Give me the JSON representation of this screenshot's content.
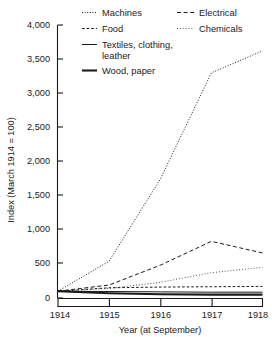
{
  "chart_data": {
    "type": "line",
    "title": "",
    "xlabel": "Year (at September)",
    "ylabel": "Index (March 1914 = 100)",
    "x": [
      1914,
      1915,
      1916,
      1917,
      1918
    ],
    "xticklabels": [
      "1914",
      "1915",
      "1916",
      "1917",
      "1918"
    ],
    "xlim": [
      1914,
      1918
    ],
    "ylim": [
      0,
      4000
    ],
    "yticks": [
      0,
      500,
      1000,
      1500,
      2000,
      2500,
      3000,
      3500,
      4000
    ],
    "yticklabels": [
      "0",
      "500",
      "1,000",
      "1,500",
      "2,000",
      "2,500",
      "3,000",
      "3,500",
      "4,000"
    ],
    "grid": false,
    "legend_position": "top-inside",
    "series": [
      {
        "name": "Machines",
        "style": "dotted-fine",
        "values": [
          100,
          540,
          1740,
          3300,
          3620
        ]
      },
      {
        "name": "Electrical",
        "style": "dashed-long",
        "values": [
          100,
          190,
          480,
          830,
          660
        ]
      },
      {
        "name": "Food",
        "style": "dashed-medium",
        "values": [
          100,
          150,
          160,
          165,
          170
        ]
      },
      {
        "name": "Chemicals",
        "style": "dotted-sparse",
        "values": [
          100,
          140,
          230,
          370,
          450
        ]
      },
      {
        "name": "Textiles, clothing, leather",
        "style": "solid-thin",
        "values": [
          100,
          95,
          90,
          85,
          85
        ]
      },
      {
        "name": "Wood, paper",
        "style": "solid-thick",
        "values": [
          100,
          70,
          55,
          50,
          50
        ]
      }
    ]
  },
  "legend": {
    "items": [
      {
        "label": "Machines",
        "style": "dotted-fine"
      },
      {
        "label": "Electrical",
        "style": "dashed-long"
      },
      {
        "label": "Food",
        "style": "dashed-medium"
      },
      {
        "label": "Chemicals",
        "style": "dotted-sparse"
      },
      {
        "label": "Textiles, clothing,",
        "label2": "leather",
        "style": "solid-thin"
      },
      {
        "label": "Wood, paper",
        "style": "solid-thick"
      }
    ]
  },
  "colors": {
    "ink": "#1a1a1a",
    "background": "#ffffff"
  }
}
